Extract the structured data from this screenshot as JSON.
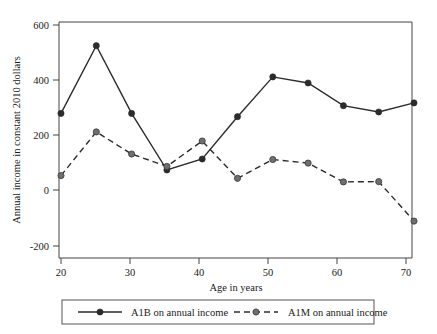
{
  "chart_data": {
    "type": "line",
    "title": "",
    "xlabel": "Age in years",
    "ylabel": "Annual income in constant 2010 dollars",
    "x": [
      20,
      25,
      30,
      35,
      40,
      45,
      50,
      55,
      60,
      65,
      70
    ],
    "xlim": [
      20,
      70
    ],
    "ylim": [
      -200,
      600
    ],
    "xticks": [
      "20",
      "30",
      "40",
      "50",
      "60",
      "70"
    ],
    "xtick_values": [
      20,
      30,
      40,
      50,
      60,
      70
    ],
    "yticks": [
      "600",
      "400",
      "200",
      "0",
      "-200"
    ],
    "ytick_values": [
      600,
      400,
      200,
      0,
      -200
    ],
    "grid": false,
    "legend_position": "bottom",
    "series": [
      {
        "name": "A1B on annual income",
        "style": "solid",
        "marker": "filled-circle",
        "values": [
          280,
          525,
          280,
          75,
          115,
          268,
          412,
          390,
          308,
          285,
          318
        ]
      },
      {
        "name": "A1M on annual income",
        "style": "dashed",
        "marker": "filled-circle-gray",
        "values": [
          55,
          213,
          133,
          88,
          180,
          45,
          113,
          100,
          32,
          33,
          -110
        ]
      }
    ]
  },
  "legend": {
    "entries": [
      {
        "label": "A1B on annual income"
      },
      {
        "label": "A1M on annual income"
      }
    ]
  },
  "axes": {
    "y_title": "Annual income in constant 2010 dollars",
    "x_title": "Age in years"
  },
  "colors": {
    "line": "#2b2b2b",
    "marker_secondary": "#6e6e6e",
    "axis": "#444444",
    "background": "#ffffff"
  }
}
